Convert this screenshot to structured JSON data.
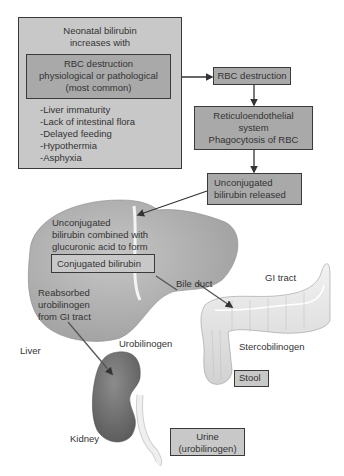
{
  "diagram": {
    "type": "flowchart-anatomical",
    "colors": {
      "box_fill_light": "#c8c8c8",
      "box_fill_dark": "#a9a9a9",
      "box_border": "#3a3a3a",
      "liver": "#b4b4b4",
      "kidney": "#7a7a7a",
      "gi_tract": "#e6e6e6",
      "arrow": "#333333"
    },
    "causes_box": {
      "title_lines": [
        "Neonatal bilirubin",
        "increases with"
      ],
      "highlight_lines": [
        "RBC destruction",
        "physiological or pathological",
        "(most common)"
      ],
      "factors": [
        "-Liver immaturity",
        "-Lack of intestinal flora",
        "-Delayed feeding",
        "-Hypothermia",
        "-Asphyxia"
      ]
    },
    "flow": [
      {
        "id": "rbc",
        "lines": [
          "RBC destruction"
        ]
      },
      {
        "id": "res",
        "lines": [
          "Reticuloendothelial",
          "system",
          "Phagocytosis of RBC"
        ]
      },
      {
        "id": "unconj",
        "lines": [
          "Unconjugated",
          "bilirubin released"
        ]
      }
    ],
    "liver": {
      "text_lines": [
        "Unconjugated",
        "bilirubin combined with",
        "glucuronic acid to form"
      ],
      "conjugated_box": "Conjugated bilirubin",
      "reabsorbed_lines": [
        "Reabsorbed",
        "urobilinogen",
        "from GI tract"
      ],
      "label": "Liver"
    },
    "labels": {
      "bile_duct": "Bile duct",
      "gi_tract": "GI tract",
      "stercobilinogen": "Stercobilinogen",
      "stool": "Stool",
      "urobilinogen": "Urobilinogen",
      "kidney": "Kidney",
      "urine_lines": [
        "Urine",
        "(urobilinogen)"
      ]
    }
  }
}
